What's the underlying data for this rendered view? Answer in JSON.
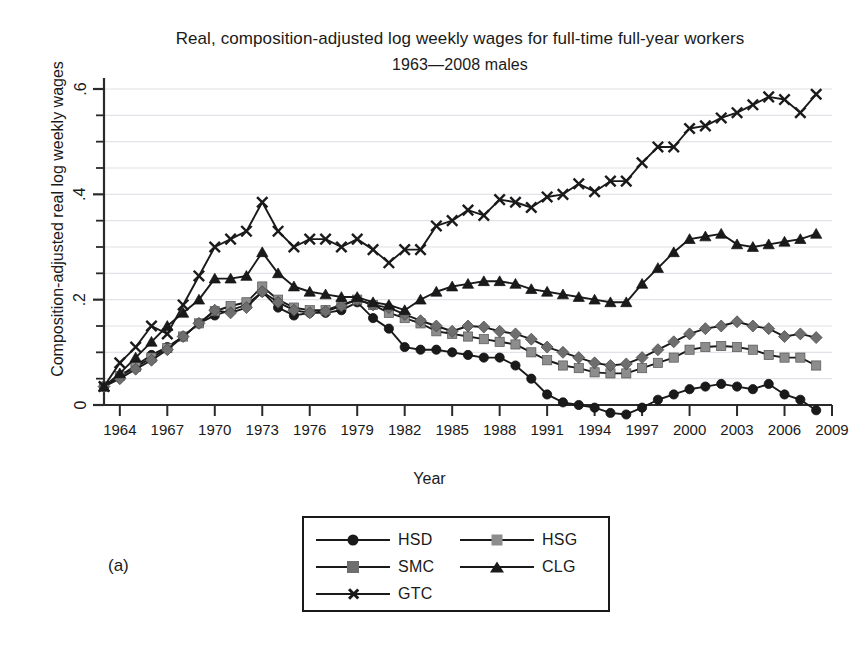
{
  "figure": {
    "title_line1": "Real, composition-adjusted log weekly wages for full-time full-year workers",
    "title_line2": "1963—2008 males",
    "panel_label": "(a)",
    "ylabel": "Composition-adjusted real log weekly wages",
    "xlabel": "Year"
  },
  "legend": {
    "entries": [
      {
        "label": "HSD",
        "marker": "circle",
        "color": "#1a1a1a"
      },
      {
        "label": "HSG",
        "marker": "square",
        "color": "#8d8d8d"
      },
      {
        "label": "SMC",
        "marker": "diamond",
        "color": "#6e6e6e"
      },
      {
        "label": "CLG",
        "marker": "triangle",
        "color": "#1a1a1a"
      },
      {
        "label": "GTC",
        "marker": "x",
        "color": "#1a1a1a"
      }
    ]
  },
  "chart_data": {
    "type": "line",
    "title": "Real, composition-adjusted log weekly wages for full-time full-year workers 1963—2008 males",
    "xlabel": "Year",
    "ylabel": "Composition-adjusted real log weekly wages",
    "xlim": [
      1963,
      2009
    ],
    "ylim": [
      -0.05,
      0.63
    ],
    "yticks": [
      0,
      0.2,
      0.4,
      0.6
    ],
    "ytick_labels": [
      "0",
      ".2",
      ".4",
      ".6"
    ],
    "yminor_step": 0.05,
    "xticks": [
      1964,
      1967,
      1970,
      1973,
      1976,
      1979,
      1982,
      1985,
      1988,
      1991,
      1994,
      1997,
      2000,
      2003,
      2006,
      2009
    ],
    "grid": "horizontal-minor",
    "legend_position": "below-plot",
    "x": [
      1963,
      1964,
      1965,
      1966,
      1967,
      1968,
      1969,
      1970,
      1971,
      1972,
      1973,
      1974,
      1975,
      1976,
      1977,
      1978,
      1979,
      1980,
      1981,
      1982,
      1983,
      1984,
      1985,
      1986,
      1987,
      1988,
      1989,
      1990,
      1991,
      1992,
      1993,
      1994,
      1995,
      1996,
      1997,
      1998,
      1999,
      2000,
      2001,
      2002,
      2003,
      2004,
      2005,
      2006,
      2007,
      2008
    ],
    "series": [
      {
        "name": "HSD",
        "marker": "circle",
        "color": "#1a1a1a",
        "values": [
          0.035,
          0.055,
          0.075,
          0.095,
          0.11,
          0.13,
          0.155,
          0.17,
          0.18,
          0.19,
          0.215,
          0.185,
          0.17,
          0.175,
          0.175,
          0.18,
          0.195,
          0.165,
          0.145,
          0.11,
          0.105,
          0.105,
          0.1,
          0.095,
          0.09,
          0.09,
          0.075,
          0.05,
          0.02,
          0.005,
          0.0,
          -0.005,
          -0.015,
          -0.018,
          -0.005,
          0.01,
          0.02,
          0.03,
          0.035,
          0.04,
          0.035,
          0.03,
          0.04,
          0.02,
          0.01,
          -0.01
        ]
      },
      {
        "name": "HSG",
        "marker": "square",
        "color": "#8d8d8d",
        "values": [
          0.035,
          0.055,
          0.072,
          0.09,
          0.108,
          0.13,
          0.155,
          0.178,
          0.188,
          0.195,
          0.225,
          0.2,
          0.185,
          0.18,
          0.18,
          0.19,
          0.2,
          0.19,
          0.175,
          0.165,
          0.155,
          0.14,
          0.135,
          0.13,
          0.125,
          0.12,
          0.115,
          0.1,
          0.085,
          0.075,
          0.07,
          0.062,
          0.06,
          0.06,
          0.07,
          0.08,
          0.09,
          0.105,
          0.11,
          0.112,
          0.11,
          0.105,
          0.095,
          0.09,
          0.09,
          0.075
        ]
      },
      {
        "name": "SMC",
        "marker": "diamond",
        "color": "#6e6e6e",
        "values": [
          0.035,
          0.05,
          0.068,
          0.085,
          0.105,
          0.13,
          0.155,
          0.18,
          0.175,
          0.185,
          0.215,
          0.195,
          0.18,
          0.175,
          0.178,
          0.188,
          0.2,
          0.19,
          0.185,
          0.172,
          0.16,
          0.15,
          0.14,
          0.15,
          0.148,
          0.14,
          0.135,
          0.125,
          0.11,
          0.1,
          0.09,
          0.08,
          0.075,
          0.078,
          0.09,
          0.105,
          0.12,
          0.135,
          0.145,
          0.15,
          0.158,
          0.15,
          0.145,
          0.13,
          0.135,
          0.128
        ]
      },
      {
        "name": "CLG",
        "marker": "triangle",
        "color": "#1a1a1a",
        "values": [
          0.035,
          0.06,
          0.09,
          0.12,
          0.15,
          0.175,
          0.2,
          0.24,
          0.24,
          0.245,
          0.29,
          0.25,
          0.225,
          0.215,
          0.21,
          0.205,
          0.205,
          0.195,
          0.19,
          0.18,
          0.2,
          0.215,
          0.225,
          0.23,
          0.235,
          0.235,
          0.23,
          0.22,
          0.215,
          0.21,
          0.205,
          0.2,
          0.195,
          0.195,
          0.23,
          0.26,
          0.29,
          0.315,
          0.32,
          0.325,
          0.305,
          0.3,
          0.305,
          0.31,
          0.315,
          0.325
        ]
      },
      {
        "name": "GTC",
        "marker": "x",
        "color": "#1a1a1a",
        "values": [
          0.035,
          0.08,
          0.11,
          0.15,
          0.135,
          0.19,
          0.245,
          0.3,
          0.315,
          0.33,
          0.385,
          0.33,
          0.3,
          0.315,
          0.315,
          0.3,
          0.315,
          0.295,
          0.27,
          0.295,
          0.295,
          0.34,
          0.35,
          0.37,
          0.36,
          0.39,
          0.385,
          0.375,
          0.395,
          0.4,
          0.42,
          0.405,
          0.425,
          0.425,
          0.46,
          0.49,
          0.49,
          0.525,
          0.53,
          0.545,
          0.555,
          0.57,
          0.585,
          0.58,
          0.555,
          0.59
        ]
      }
    ]
  }
}
